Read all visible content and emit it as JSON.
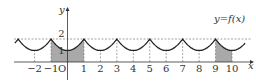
{
  "figure": {
    "type": "function-graph",
    "function_label": "y=f(x)",
    "y_axis_label": "y",
    "x_axis_label": "x",
    "origin_label": "O",
    "x_tick_labels": [
      "−2",
      "−1",
      "1",
      "2",
      "3",
      "4",
      "5",
      "6",
      "7",
      "8",
      "9",
      "10"
    ],
    "x_tick_values": [
      -2,
      -1,
      1,
      2,
      3,
      4,
      5,
      6,
      7,
      8,
      9,
      10
    ],
    "y_tick_labels": [
      "1",
      "2"
    ],
    "y_tick_values": [
      1,
      2
    ],
    "period": 2,
    "maxima_at_odd_x": 2,
    "minima_at_even_x": 1,
    "shaded_regions": [
      {
        "from": -1,
        "to": 1
      },
      {
        "from": 9,
        "to": 10
      }
    ],
    "colors": {
      "curve": "#222222",
      "shade": "#a9a9a9",
      "axis": "#333333",
      "dashed": "#666666"
    }
  }
}
